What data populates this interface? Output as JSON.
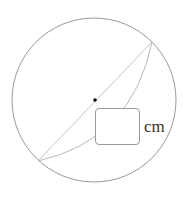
{
  "diagram": {
    "type": "geometry",
    "circle": {
      "cx": 94,
      "cy": 100,
      "r": 82,
      "stroke": "#999999"
    },
    "chord": {
      "x1": 38,
      "y1": 161,
      "x2": 152,
      "y2": 42,
      "stroke": "#c4c4c4"
    },
    "arc": {
      "from": [
        152,
        42
      ],
      "to": [
        38,
        161
      ],
      "stroke": "#b8b8b8"
    },
    "center_point": {
      "x": 95,
      "y": 100,
      "color": "#111111"
    },
    "answer_box": {
      "value": "",
      "border": "#9a9a9a"
    },
    "unit_label": "cm"
  }
}
